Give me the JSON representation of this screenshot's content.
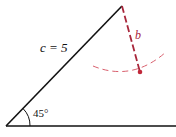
{
  "diagram": {
    "side_c_label": "c = 5",
    "side_b_label": "b",
    "angle_label": "45°",
    "colors": {
      "lines": "#111111",
      "dashed": "#a8263b",
      "arc": "#d9606e"
    }
  }
}
